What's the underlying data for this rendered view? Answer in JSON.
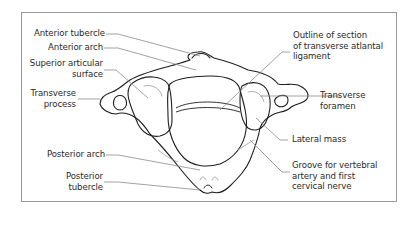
{
  "figure": {
    "colors": {
      "frame": "#9a9a9a",
      "bone_outline": "#1e1e1e",
      "leader_line": "#8a8a8a",
      "text": "#2a2a2a",
      "background": "#ffffff"
    }
  },
  "labels": {
    "left": [
      {
        "id": "anterior-tubercle",
        "text": "Anterior tubercle"
      },
      {
        "id": "anterior-arch",
        "text": "Anterior arch"
      },
      {
        "id": "superior-articular-surface",
        "text": "Superior articular\nsurface"
      },
      {
        "id": "transverse-process",
        "text": "Transverse\nprocess"
      },
      {
        "id": "posterior-arch",
        "text": "Posterior arch"
      },
      {
        "id": "posterior-tubercle",
        "text": "Posterior\ntubercle"
      }
    ],
    "right": [
      {
        "id": "transverse-atlantal-ligament",
        "text": "Outline of section\nof transverse atlantal\nligament"
      },
      {
        "id": "transverse-foramen",
        "text": "Transverse\nforamen"
      },
      {
        "id": "lateral-mass",
        "text": "Lateral mass"
      },
      {
        "id": "groove-vertebral-artery",
        "text": "Groove for vertebral\nartery and first\ncervical nerve"
      }
    ]
  }
}
